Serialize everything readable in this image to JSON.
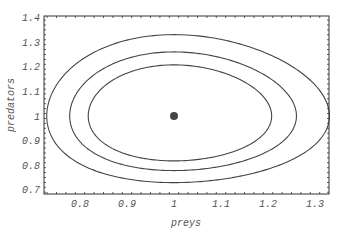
{
  "chart_data": {
    "type": "line",
    "title": "",
    "xlabel": "preys",
    "ylabel": "predators",
    "xlim": [
      0.723,
      1.33
    ],
    "ylim": [
      0.69,
      1.41
    ],
    "xticks": [
      0.8,
      0.9,
      1,
      1.1,
      1.2,
      1.3
    ],
    "xtick_labels": [
      "0.8",
      "0.9",
      "1",
      "1.1",
      "1.2",
      "1.3"
    ],
    "yticks": [
      0.7,
      0.8,
      0.9,
      1,
      1.1,
      1.2,
      1.3,
      1.4
    ],
    "ytick_labels": [
      "0.7",
      "0.8",
      "0.9",
      "1",
      "1.1",
      "1.2",
      "1.3",
      "1.4"
    ],
    "grid": false,
    "legend": null,
    "series": [
      {
        "name": "orbit-outer",
        "kind": "closed-curve",
        "level": 0.045,
        "x_range": [
          0.738,
          1.313
        ],
        "y_range": [
          0.7,
          1.386
        ]
      },
      {
        "name": "orbit-middle",
        "kind": "closed-curve",
        "level": 0.029,
        "x_range": [
          0.779,
          1.262
        ],
        "y_range": [
          0.74,
          1.317
        ]
      },
      {
        "name": "orbit-inner",
        "kind": "closed-curve",
        "level": 0.019,
        "x_range": [
          0.817,
          1.21
        ],
        "y_range": [
          0.789,
          1.252
        ]
      }
    ],
    "points": [
      {
        "name": "equilibrium",
        "x": 1,
        "y": 1
      }
    ],
    "line_color": "#444444",
    "point_color": "#444444"
  }
}
